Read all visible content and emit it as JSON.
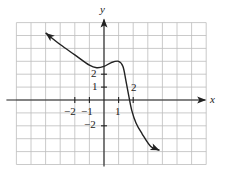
{
  "chart_data": {
    "type": "line",
    "title": "",
    "xlabel": "x",
    "ylabel": "y",
    "xlim": [
      -6,
      7
    ],
    "ylim": [
      -5,
      6
    ],
    "grid": true,
    "x_tick_labels": [
      "-2",
      "-1",
      "1",
      "2"
    ],
    "x_ticks": [
      -2,
      -1,
      1,
      2
    ],
    "y_tick_labels": [
      "2",
      "1",
      "-2"
    ],
    "y_ticks": [
      2,
      1,
      -2
    ],
    "series": [
      {
        "name": "f(x)",
        "x": [
          -4.0,
          -3.0,
          -2.0,
          -1.0,
          -0.5,
          0.0,
          0.5,
          1.0,
          1.3,
          1.5,
          1.7,
          1.9,
          2.2,
          2.6,
          3.2,
          3.8
        ],
        "y": [
          5.2,
          4.3,
          3.5,
          2.7,
          2.5,
          2.6,
          2.9,
          3.0,
          2.6,
          1.5,
          0.3,
          -0.8,
          -1.8,
          -2.6,
          -3.6,
          -3.9
        ],
        "arrows": "both"
      }
    ],
    "annotations": [
      {
        "text": "2",
        "x": 2.0,
        "y": 0.7,
        "note": "label near x-intercept"
      }
    ]
  },
  "labels": {
    "x_axis": "x",
    "y_axis": "y",
    "xt_m2": "−2",
    "xt_m1": "−1",
    "xt_1": "1",
    "yt_2": "2",
    "yt_1": "1",
    "yt_m2": "−2",
    "curve_2": "2"
  }
}
